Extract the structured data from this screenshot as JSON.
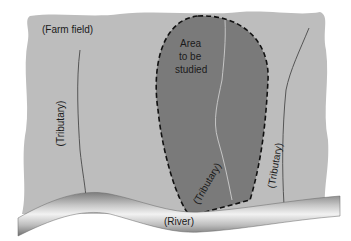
{
  "diagram": {
    "type": "map-schematic",
    "labels": {
      "farm_field": "(Farm field)",
      "study_area_line1": "Area",
      "study_area_line2": "to be",
      "study_area_line3": "studied",
      "tributary_left": "(Tributary)",
      "tributary_center": "(Tributary)",
      "tributary_right": "(Tributary)",
      "river": "(River)"
    },
    "colors": {
      "field": "#bdbdbd",
      "study_area": "#7a7a7a",
      "study_area_border": "#111111",
      "tributary_line": "#555555",
      "tributary_in_area": "#d8d8d8",
      "river_light": "#f0f0f0",
      "river_dark": "#8a8a8a"
    }
  }
}
